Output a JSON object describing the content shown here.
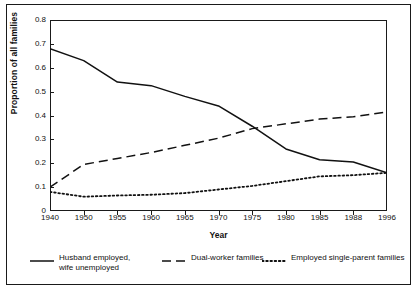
{
  "chart_data": {
    "type": "line",
    "title": "",
    "xlabel": "Year",
    "ylabel": "Proportion of all families",
    "categories": [
      "1940",
      "1950",
      "1955",
      "1960",
      "1965",
      "1970",
      "1975",
      "1980",
      "1985",
      "1988",
      "1996"
    ],
    "xtick_labels": [
      "1940",
      "1950",
      "1955",
      "1960",
      "1965",
      "1970",
      "1975",
      "1980",
      "1985",
      "1988",
      "1996"
    ],
    "ytick_labels": [
      "0",
      "0.1",
      "0.2",
      "0.3",
      "0.4",
      "0.5",
      "0.6",
      "0.7",
      "0.8"
    ],
    "ytick_values": [
      0,
      0.1,
      0.2,
      0.3,
      0.4,
      0.5,
      0.6,
      0.7,
      0.8
    ],
    "ylim": [
      0,
      0.8
    ],
    "grid": false,
    "legend_position": "below-plot",
    "axis_scale_note": "x axis is categorical with equal spacing between listed years",
    "series": [
      {
        "name": "Husband employed, wife unemployed",
        "legend_label": "Husband employed,\nwife unemployed",
        "style": "solid",
        "color": "#111111",
        "values": [
          0.68,
          0.63,
          0.54,
          0.525,
          0.48,
          0.44,
          0.355,
          0.26,
          0.215,
          0.205,
          0.16
        ]
      },
      {
        "name": "Dual-worker families",
        "legend_label": "Dual-worker families",
        "style": "dashed",
        "color": "#111111",
        "values": [
          0.1,
          0.195,
          0.22,
          0.245,
          0.275,
          0.305,
          0.345,
          0.365,
          0.385,
          0.395,
          0.415
        ]
      },
      {
        "name": "Employed single-parent families",
        "legend_label": "Employed single-parent families",
        "style": "dotted",
        "color": "#111111",
        "values": [
          0.08,
          0.06,
          0.065,
          0.068,
          0.075,
          0.09,
          0.105,
          0.125,
          0.145,
          0.15,
          0.16
        ]
      }
    ]
  },
  "axes": {
    "x_title": "Year",
    "y_title": "Proportion of all families"
  }
}
